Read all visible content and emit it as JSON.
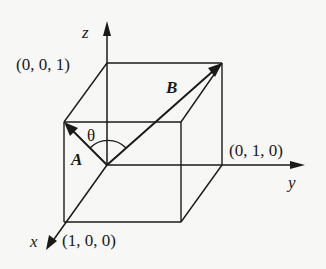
{
  "figure": {
    "type": "3d-unit-cube-vectors",
    "axes": {
      "x": {
        "label": "x"
      },
      "y": {
        "label": "y"
      },
      "z": {
        "label": "z"
      }
    },
    "points": {
      "z_unit": {
        "label": "(0, 0, 1)"
      },
      "y_unit": {
        "label": "(0, 1, 0)"
      },
      "x_unit": {
        "label": "(1, 0, 0)"
      }
    },
    "vectors": {
      "A": {
        "label": "A",
        "from": "origin",
        "to": "(1, 0, 1)"
      },
      "B": {
        "label": "B",
        "from": "origin",
        "to": "(0, 1, 1)"
      }
    },
    "angle": {
      "label": "θ",
      "between": [
        "A",
        "B"
      ]
    },
    "colors": {
      "ink": "#1a1a1a",
      "background": "#f7f7f5"
    }
  }
}
